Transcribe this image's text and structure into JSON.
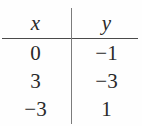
{
  "figure": {
    "kind": "two-column-value-table",
    "columns": [
      {
        "key": "x",
        "header": "x"
      },
      {
        "key": "y",
        "header": "y"
      }
    ],
    "rows": [
      {
        "x": "0",
        "y": "−1"
      },
      {
        "x": "3",
        "y": "−3"
      },
      {
        "x": "−3",
        "y": "1"
      }
    ],
    "colors": {
      "text": "#2a2a2a",
      "header_rule": "#4a4a4a",
      "column_divider": "#7c7c7c",
      "background": "#fefefe"
    }
  }
}
